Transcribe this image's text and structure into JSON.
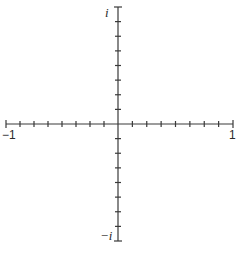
{
  "diagram": {
    "axes": {
      "real": {
        "min_label": "−1",
        "max_label": "1",
        "ticks_per_side": 8
      },
      "imaginary": {
        "min_label": "−i",
        "max_label": "i",
        "ticks_per_side": 8
      }
    },
    "colors": {
      "axis": "#3a3a3a",
      "background": "#ffffff"
    }
  },
  "layout": {
    "origin": [
      118,
      124
    ],
    "x_extent": [
      6,
      233
    ],
    "y_extent": [
      7,
      241
    ]
  }
}
